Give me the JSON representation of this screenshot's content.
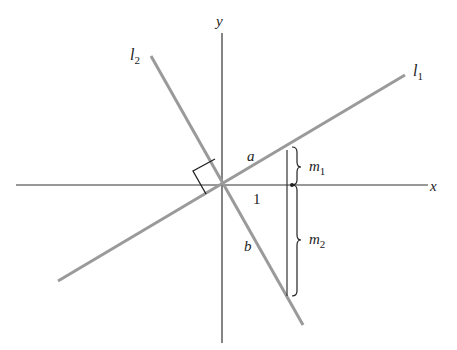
{
  "diagram": {
    "axes": {
      "x_label": "x",
      "y_label": "y"
    },
    "lines": [
      {
        "name": "l1",
        "label_base": "l",
        "label_sub": "1"
      },
      {
        "name": "l2",
        "label_base": "l",
        "label_sub": "2"
      }
    ],
    "segments": {
      "a": "a",
      "b": "b",
      "unit": "1"
    },
    "slopes": [
      {
        "label_base": "m",
        "label_sub": "1"
      },
      {
        "label_base": "m",
        "label_sub": "2"
      }
    ],
    "annotations": {
      "right_angle": "perpendicular marker at origin"
    },
    "colors": {
      "axis": "#333333",
      "line": "#999999",
      "text": "#222222"
    }
  }
}
